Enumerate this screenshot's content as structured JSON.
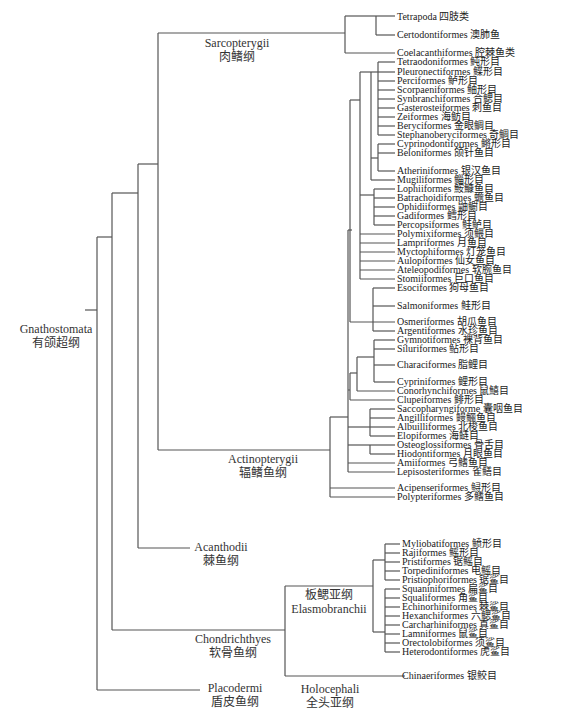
{
  "figure": {
    "clades": [
      {
        "key": "gnathostomata",
        "en": "Gnathostomata",
        "zh": "有颌超纲",
        "x": 12,
        "y": 322,
        "w": 88
      },
      {
        "key": "sarcopterygii",
        "en": "Sarcopterygii",
        "zh": "肉鳍纲",
        "x": 192,
        "y": 36,
        "w": 90
      },
      {
        "key": "actinopterygii",
        "en": "Actinopterygii",
        "zh": "辐鳍鱼纲",
        "x": 218,
        "y": 452,
        "w": 90
      },
      {
        "key": "acanthodii",
        "en": "Acanthodii",
        "zh": "棘鱼纲",
        "x": 186,
        "y": 540,
        "w": 70
      },
      {
        "key": "chondrichthyes",
        "en": "Chondrichthyes",
        "zh": "软骨鱼纲",
        "x": 188,
        "y": 632,
        "w": 90
      },
      {
        "key": "placodermi",
        "en": "Placodermi",
        "zh": "盾皮鱼纲",
        "x": 200,
        "y": 681,
        "w": 70
      },
      {
        "key": "elasmobranchii",
        "en": "板鳃亚纲",
        "zh": "Elasmobranchii",
        "x": 288,
        "y": 588,
        "w": 82
      },
      {
        "key": "holocephali",
        "en": "Holocephali",
        "zh": "全头亚纲",
        "x": 290,
        "y": 682,
        "w": 80
      }
    ],
    "leaves": [
      {
        "label": "Tetrapoda 四肢类",
        "y": 17
      },
      {
        "label": "Certodontiformes 澳肺鱼",
        "y": 35
      },
      {
        "label": "Coelacanthiformes 腔棘鱼类",
        "y": 53
      },
      {
        "label": "Tetraodoniformes 鲀形目",
        "y": 62
      },
      {
        "label": "Pleuronectiformes 鲽形目",
        "y": 72
      },
      {
        "label": "Perciformes 鲈形目",
        "y": 81
      },
      {
        "label": "Scorpaeniformes 鲉形目",
        "y": 90
      },
      {
        "label": "Synbranchiformes 合鳃目",
        "y": 99
      },
      {
        "label": "Gasterosteiformes 刺鱼目",
        "y": 108
      },
      {
        "label": "Zeiformes 海鲂目",
        "y": 117
      },
      {
        "label": "Beryciformes 金眼鲷目",
        "y": 126
      },
      {
        "label": "Stephanoberyciformes 奇鲷目",
        "y": 135
      },
      {
        "label": "Cyprinodontiformes 鳉形目",
        "y": 144
      },
      {
        "label": "Beloniformes 颌针鱼目",
        "y": 153
      },
      {
        "label": "Atheriniformes 银汉鱼目",
        "y": 171
      },
      {
        "label": "Mugiliformes 鲻形目",
        "y": 180
      },
      {
        "label": "Lophiiformes 鮟鱇鱼目",
        "y": 189
      },
      {
        "label": "Batrachoidiformes 蟾鱼目",
        "y": 198
      },
      {
        "label": "Ophidiiformes 鼬鳚目",
        "y": 207
      },
      {
        "label": "Gadiformes 鳕形目",
        "y": 216
      },
      {
        "label": "Percopsiformes 鲑鲈目",
        "y": 225
      },
      {
        "label": "Polymixiformes 须鳂目",
        "y": 234
      },
      {
        "label": "Lampriformes 月鱼目",
        "y": 243
      },
      {
        "label": "Myctophiformes 灯笼鱼目",
        "y": 252
      },
      {
        "label": "Aulopiformes 仙女鱼目",
        "y": 261
      },
      {
        "label": "Ateleopodiformes 软腕鱼目",
        "y": 270
      },
      {
        "label": "Stomiiformes 巨口鱼目",
        "y": 279
      },
      {
        "label": "Esociformes 狗母鱼目",
        "y": 288
      },
      {
        "label": "Salmoniformes 鲑形目",
        "y": 306
      },
      {
        "label": "Osmeriformes 胡瓜鱼目",
        "y": 322
      },
      {
        "label": "Argentiformes 水珍鱼目",
        "y": 331
      },
      {
        "label": "Gymnotiformes 裸背鱼目",
        "y": 340
      },
      {
        "label": "Siluriformes 鲇形目",
        "y": 349
      },
      {
        "label": "Characiformes 脂鲤目",
        "y": 365
      },
      {
        "label": "Cypriniformes 鲤形目",
        "y": 382
      },
      {
        "label": "Conorhynchiformes 鼠鱚目",
        "y": 391
      },
      {
        "label": "Clupeiformes 鲱形目",
        "y": 400
      },
      {
        "label": "Saccopharyngiforme 囊咽鱼目",
        "y": 409
      },
      {
        "label": "Angilliformes 鳗鲡鱼目",
        "y": 418
      },
      {
        "label": "Albuilliformes 北梭鱼目",
        "y": 427
      },
      {
        "label": "Elopiformes 海鲢目",
        "y": 436
      },
      {
        "label": "Osteoglossiformes 骨舌目",
        "y": 445
      },
      {
        "label": "Hiodontiformes 月眼鱼目",
        "y": 454
      },
      {
        "label": "Amiiformes 弓鳍鱼目",
        "y": 463
      },
      {
        "label": "Lepisosteriformes 雀鳝目",
        "y": 472
      },
      {
        "label": "Acipenseriformes 鲟形目",
        "y": 488
      },
      {
        "label": "Polypteriformes 多鳍鱼目",
        "y": 497
      },
      {
        "label": "Myliobatiformes 鲼形目",
        "y": 544
      },
      {
        "label": "Rajiformes 鳐形目",
        "y": 553
      },
      {
        "label": "Pristiformes 锯鳐目",
        "y": 562
      },
      {
        "label": "Torpediniformes 电鳐目",
        "y": 571
      },
      {
        "label": "Pristiophoriformes 锯鲨目",
        "y": 580
      },
      {
        "label": "Squaniniformes 扁鲨目",
        "y": 589
      },
      {
        "label": "Squaliformes 角鲨目",
        "y": 598
      },
      {
        "label": "Echinorhiniformes 棘鲨目",
        "y": 607
      },
      {
        "label": "Hexanchiformes 六鳃鲨目",
        "y": 616
      },
      {
        "label": "Carcharhiniformes 真鲨目",
        "y": 625
      },
      {
        "label": "Lamniformes 鼠鲨目",
        "y": 634
      },
      {
        "label": "Orectolobiformes 须鲨目",
        "y": 643
      },
      {
        "label": "Heterodontiformes 虎鲨目",
        "y": 652
      },
      {
        "label": "Chinaeriformes 银鲛目",
        "y": 676
      }
    ]
  }
}
